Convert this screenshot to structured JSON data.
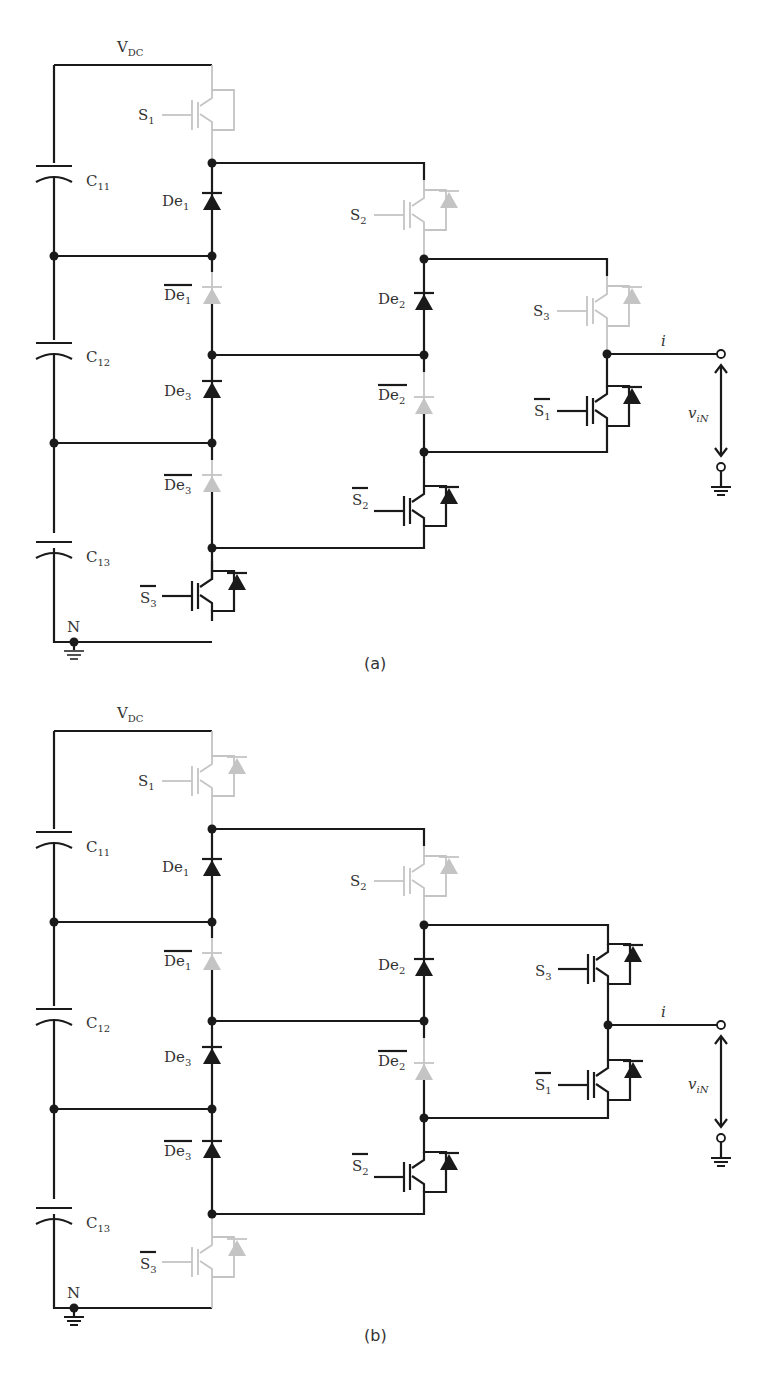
{
  "figure": {
    "panels": [
      {
        "caption": "(a)",
        "labels": {
          "vdc": {
            "main": "V",
            "sub": "DC"
          },
          "s1": {
            "main": "S",
            "sub": "1",
            "bar": false,
            "state": "off"
          },
          "s2": {
            "main": "S",
            "sub": "2",
            "bar": false,
            "state": "off"
          },
          "s3": {
            "main": "S",
            "sub": "3",
            "bar": false,
            "state": "off"
          },
          "s1bar": {
            "main": "S",
            "sub": "1",
            "bar": true,
            "state": "on"
          },
          "s2bar": {
            "main": "S",
            "sub": "2",
            "bar": true,
            "state": "on"
          },
          "s3bar": {
            "main": "S",
            "sub": "3",
            "bar": true,
            "state": "on"
          },
          "c11": {
            "main": "C",
            "sub": "11"
          },
          "c12": {
            "main": "C",
            "sub": "12"
          },
          "c13": {
            "main": "C",
            "sub": "13"
          },
          "de1": {
            "main": "De",
            "sub": "1",
            "state": "on"
          },
          "de1bar": {
            "main": "De",
            "sub": "1",
            "bar": true,
            "state": "off"
          },
          "de2": {
            "main": "De",
            "sub": "2",
            "state": "on"
          },
          "de2bar": {
            "main": "De",
            "sub": "2",
            "bar": true,
            "state": "off"
          },
          "de3": {
            "main": "De",
            "sub": "3",
            "state": "on"
          },
          "de3bar": {
            "main": "De",
            "sub": "3",
            "bar": true,
            "state": "off"
          },
          "neutral": "N",
          "current": "i",
          "voltage": {
            "main": "v",
            "sub": "iN"
          }
        }
      },
      {
        "caption": "(b)",
        "labels": {
          "vdc": {
            "main": "V",
            "sub": "DC"
          },
          "s1": {
            "main": "S",
            "sub": "1",
            "bar": false,
            "state": "off"
          },
          "s2": {
            "main": "S",
            "sub": "2",
            "bar": false,
            "state": "off"
          },
          "s3": {
            "main": "S",
            "sub": "3",
            "bar": false,
            "state": "on"
          },
          "s1bar": {
            "main": "S",
            "sub": "1",
            "bar": true,
            "state": "on"
          },
          "s2bar": {
            "main": "S",
            "sub": "2",
            "bar": true,
            "state": "on"
          },
          "s3bar": {
            "main": "S",
            "sub": "3",
            "bar": true,
            "state": "off"
          },
          "c11": {
            "main": "C",
            "sub": "11"
          },
          "c12": {
            "main": "C",
            "sub": "12"
          },
          "c13": {
            "main": "C",
            "sub": "13"
          },
          "de1": {
            "main": "De",
            "sub": "1",
            "state": "on"
          },
          "de1bar": {
            "main": "De",
            "sub": "1",
            "bar": true,
            "state": "off"
          },
          "de2": {
            "main": "De",
            "sub": "2",
            "state": "on"
          },
          "de2bar": {
            "main": "De",
            "sub": "2",
            "bar": true,
            "state": "off"
          },
          "de3": {
            "main": "De",
            "sub": "3",
            "state": "on"
          },
          "de3bar": {
            "main": "De",
            "sub": "3",
            "bar": true,
            "state": "on"
          },
          "neutral": "N",
          "current": "i",
          "voltage": {
            "main": "v",
            "sub": "iN"
          }
        }
      }
    ],
    "colors": {
      "active": "#1a1a1a",
      "inactive": "#c4c4c4",
      "background": "#ffffff"
    }
  }
}
